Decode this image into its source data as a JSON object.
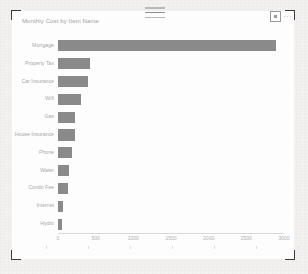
{
  "window": {
    "drag_handle_name": "visual-drag-handle",
    "focus_mode_label": "",
    "more_options_label": "···"
  },
  "visual": {
    "title": "Monthly Cost by Item Name"
  },
  "chart_data": {
    "type": "bar",
    "orientation": "horizontal",
    "title": "Monthly Cost by Item Name",
    "xlabel": "",
    "ylabel": "",
    "categories": [
      "Mortgage",
      "Property Tax",
      "Car Insurance",
      "Wifi",
      "Gas",
      "House Insurance",
      "Phone",
      "Water",
      "Condo Fee",
      "Internet",
      "Hydro"
    ],
    "values": [
      2900,
      430,
      400,
      300,
      230,
      225,
      180,
      150,
      130,
      60,
      55
    ],
    "bar_color": "#8a8a8a",
    "xlim": [
      0,
      3000
    ],
    "xticks": [
      0,
      500,
      1000,
      1500,
      2000,
      2500,
      3000
    ],
    "xtick_labels": [
      "0",
      "500",
      "1000",
      "1500",
      "2000",
      "2500",
      "3000"
    ],
    "grid": false,
    "legend": "none"
  }
}
